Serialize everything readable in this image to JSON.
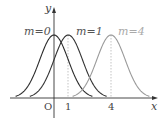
{
  "diagram": {
    "title": "",
    "axes": {
      "x_label": "x",
      "y_label": "y",
      "origin_label": "O",
      "ticks": [
        {
          "value": 1,
          "label": "1"
        },
        {
          "value": 4,
          "label": "4"
        }
      ]
    },
    "curves": [
      {
        "label": "m=0",
        "mean": 0,
        "color": "#2b2b2b"
      },
      {
        "label": "m=1",
        "mean": 1,
        "color": "#333333"
      },
      {
        "label": "m=4",
        "mean": 4,
        "color": "#9a9a9a"
      }
    ],
    "colors": {
      "axis": "#333333",
      "dashed": "#aaaaaa"
    }
  }
}
